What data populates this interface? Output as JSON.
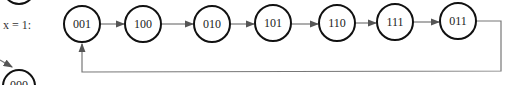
{
  "diagram": {
    "condition_label": "x = 1:",
    "nodes": [
      {
        "id": "001",
        "label": "001"
      },
      {
        "id": "100",
        "label": "100"
      },
      {
        "id": "010",
        "label": "010"
      },
      {
        "id": "101",
        "label": "101"
      },
      {
        "id": "110",
        "label": "110"
      },
      {
        "id": "111",
        "label": "111"
      },
      {
        "id": "011",
        "label": "011"
      }
    ],
    "edges": [
      {
        "from": "001",
        "to": "100"
      },
      {
        "from": "100",
        "to": "010"
      },
      {
        "from": "010",
        "to": "101"
      },
      {
        "from": "101",
        "to": "110"
      },
      {
        "from": "110",
        "to": "111"
      },
      {
        "from": "111",
        "to": "011"
      },
      {
        "from": "011",
        "to": "001"
      }
    ],
    "partial_node_label": "000",
    "colors": {
      "stroke": "#111111",
      "edge": "#777777"
    }
  }
}
